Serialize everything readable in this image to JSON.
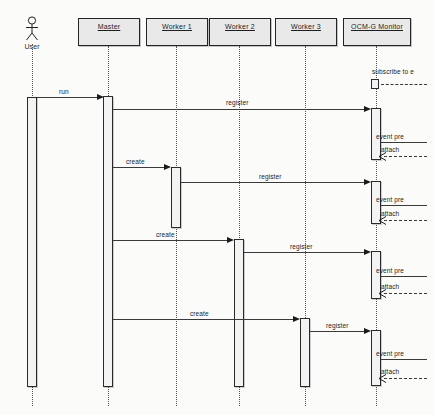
{
  "diagram": {
    "type": "uml-sequence-diagram",
    "actor": {
      "name": "User",
      "icon": "stick-figure-actor-icon"
    },
    "lifelines": [
      {
        "id": "master",
        "label": "Master",
        "x": 108
      },
      {
        "id": "worker1",
        "label": "Worker 1",
        "x": 176
      },
      {
        "id": "worker2",
        "label": "Worker 2",
        "x": 239
      },
      {
        "id": "worker3",
        "label": "Worker 3",
        "x": 305
      },
      {
        "id": "monitor",
        "label": "OCM-G Monitor",
        "x": 376
      }
    ],
    "messages": [
      {
        "id": "m1",
        "label": "subscribe to e",
        "kind": "self",
        "from": "monitor",
        "to": "monitor",
        "y": 78
      },
      {
        "id": "m2",
        "label": "run",
        "kind": "call",
        "from": "user",
        "to": "master",
        "y": 96
      },
      {
        "id": "m3",
        "label": "register",
        "kind": "call",
        "from": "master",
        "to": "monitor",
        "y": 108
      },
      {
        "id": "m4",
        "label": "event pre",
        "kind": "call",
        "from": "monitor",
        "to": "monitor",
        "y": 140
      },
      {
        "id": "m5",
        "label": "attach",
        "kind": "return",
        "from": "monitor",
        "to": "monitor",
        "y": 152
      },
      {
        "id": "m6",
        "label": "create",
        "kind": "call",
        "from": "master",
        "to": "worker1",
        "y": 167
      },
      {
        "id": "m7",
        "label": "register",
        "kind": "call",
        "from": "worker1",
        "to": "monitor",
        "y": 182
      },
      {
        "id": "m8",
        "label": "event pre",
        "kind": "call",
        "from": "monitor",
        "to": "monitor",
        "y": 203
      },
      {
        "id": "m9",
        "label": "attach",
        "kind": "return",
        "from": "monitor",
        "to": "monitor",
        "y": 216
      },
      {
        "id": "m10",
        "label": "create",
        "kind": "call",
        "from": "master",
        "to": "worker2",
        "y": 240
      },
      {
        "id": "m11",
        "label": "register",
        "kind": "call",
        "from": "worker2",
        "to": "monitor",
        "y": 252
      },
      {
        "id": "m12",
        "label": "event pre",
        "kind": "call",
        "from": "monitor",
        "to": "monitor",
        "y": 274
      },
      {
        "id": "m13",
        "label": "attach",
        "kind": "return",
        "from": "monitor",
        "to": "monitor",
        "y": 290
      },
      {
        "id": "m14",
        "label": "create",
        "kind": "call",
        "from": "master",
        "to": "worker3",
        "y": 319
      },
      {
        "id": "m15",
        "label": "register",
        "kind": "call",
        "from": "worker3",
        "to": "monitor",
        "y": 331
      },
      {
        "id": "m16",
        "label": "event pre",
        "kind": "call",
        "from": "monitor",
        "to": "monitor",
        "y": 357
      },
      {
        "id": "m17",
        "label": "attach",
        "kind": "return",
        "from": "monitor",
        "to": "monitor",
        "y": 375
      }
    ],
    "colors": {
      "head_fill": "#e9e9e9",
      "head_border": "#242424",
      "activation_fill": "#f3f3f3",
      "line": "#3a3a3a",
      "background": "#fbfbfa"
    }
  }
}
